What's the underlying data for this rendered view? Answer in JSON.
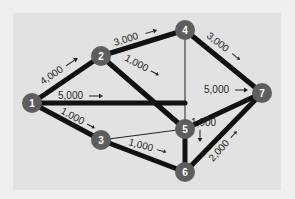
{
  "diagram": {
    "type": "network-flow",
    "colors": {
      "background": "#efefef",
      "panel": "#e2e2e2",
      "node_fill": "#5e5e5e",
      "node_text": "#ffffff",
      "edge": "#111111",
      "label": "#222222"
    },
    "nodes": [
      {
        "id": "1",
        "label": "1",
        "x": 32,
        "y": 103
      },
      {
        "id": "2",
        "label": "2",
        "x": 101,
        "y": 56
      },
      {
        "id": "3",
        "label": "3",
        "x": 101,
        "y": 140
      },
      {
        "id": "4",
        "label": "4",
        "x": 185,
        "y": 30
      },
      {
        "id": "5",
        "label": "5",
        "x": 185,
        "y": 129
      },
      {
        "id": "6",
        "label": "6",
        "x": 185,
        "y": 172
      },
      {
        "id": "7",
        "label": "7",
        "x": 262,
        "y": 93
      }
    ],
    "edges": [
      {
        "from": "1",
        "to": "2",
        "weight": "thick",
        "label": "4,000",
        "arrow": "→"
      },
      {
        "from": "1",
        "to": "5",
        "weight": "thick",
        "label": "5,000",
        "arrow": "→"
      },
      {
        "from": "1",
        "to": "3",
        "weight": "thick",
        "label": "1,000",
        "arrow": "→"
      },
      {
        "from": "2",
        "to": "4",
        "weight": "thick",
        "label": "3,000",
        "arrow": "→"
      },
      {
        "from": "2",
        "to": "5",
        "weight": "thick",
        "label": "1,000",
        "arrow": "→"
      },
      {
        "from": "3",
        "to": "5",
        "weight": "thin",
        "label": "",
        "arrow": ""
      },
      {
        "from": "3",
        "to": "6",
        "weight": "thick",
        "label": "1,000",
        "arrow": "→"
      },
      {
        "from": "4",
        "to": "5",
        "weight": "thin",
        "label": "",
        "arrow": ""
      },
      {
        "from": "4",
        "to": "7",
        "weight": "thick",
        "label": "3,000",
        "arrow": "→"
      },
      {
        "from": "5",
        "to": "7",
        "weight": "thick",
        "label": "5,000",
        "arrow": "→"
      },
      {
        "from": "5",
        "to": "6",
        "weight": "thick",
        "label": "1,000",
        "arrow": "↓"
      },
      {
        "from": "6",
        "to": "7",
        "weight": "thick",
        "label": "2,000",
        "arrow": "→"
      }
    ],
    "labels": {
      "e12": "4,000",
      "e15": "5,000",
      "e13": "1,000",
      "e24": "3,000",
      "e25": "1,000",
      "e36": "1,000",
      "e47": "3,000",
      "e57": "5,000",
      "e56": "1,000",
      "e67": "2,000"
    },
    "node_labels": {
      "n1": "1",
      "n2": "2",
      "n3": "3",
      "n4": "4",
      "n5": "5",
      "n6": "6",
      "n7": "7"
    }
  }
}
